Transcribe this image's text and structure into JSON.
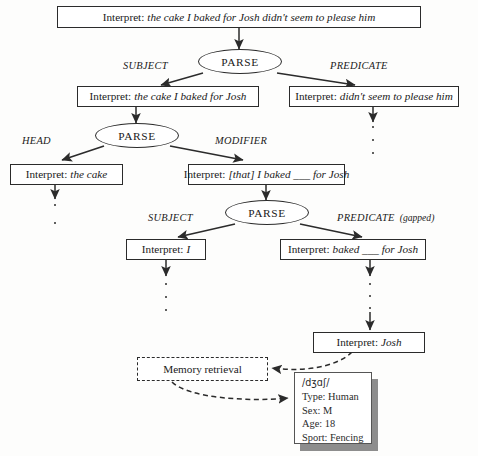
{
  "diagram": {
    "interpret_label": "Interpret:",
    "parse_label": "PARSE",
    "memory_label": "Memory retrieval",
    "colors": {
      "line": "#2b2b2b",
      "box_fill": "#ffffff",
      "shadow": "#8d8d8d",
      "background": "#fdfdfc"
    }
  },
  "nodes": {
    "root_interpret": "the cake I baked for Josh didn't seem to please him",
    "subject_l1": "the cake I baked for Josh",
    "predicate_l1": "didn't seem to please him",
    "head_l2": "the cake",
    "modifier_l2": "[that] I baked ___ for Josh",
    "subject_l3": "I",
    "predicate_l3": "baked ___ for Josh",
    "josh": "Josh"
  },
  "edges": {
    "subject_1": "SUBJECT",
    "predicate_1": "PREDICATE",
    "head_2": "HEAD",
    "modifier_2": "MODIFIER",
    "subject_3": "SUBJECT",
    "predicate_3": "PREDICATE",
    "predicate_3_note": "(gapped)"
  },
  "memory_record": {
    "ipa": "/dʒɑʃ/",
    "rows": [
      "Type: Human",
      "Sex: M",
      "Age: 18",
      "Sport: Fencing"
    ]
  }
}
